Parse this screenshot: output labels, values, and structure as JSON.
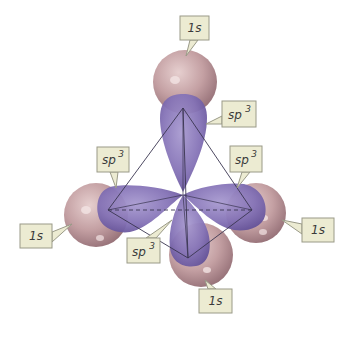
{
  "diagram": {
    "colors": {
      "background": "#ffffff",
      "s_orbital": "#c9a6a6",
      "s_orbital_dark": "#9c7a7e",
      "sp3_lobe": "#8a78b8",
      "sp3_lobe_dark": "#5e4d93",
      "label_fill": "#ecebd2",
      "label_border": "#9a9a88",
      "edge_line": "#3a3550"
    },
    "labels": [
      {
        "id": "top-1s",
        "text": "1s",
        "superscript": ""
      },
      {
        "id": "top-sp3",
        "text": "sp",
        "superscript": "3"
      },
      {
        "id": "left-sp3",
        "text": "sp",
        "superscript": "3"
      },
      {
        "id": "right-sp3",
        "text": "sp",
        "superscript": "3"
      },
      {
        "id": "left-1s",
        "text": "1s",
        "superscript": ""
      },
      {
        "id": "right-1s",
        "text": "1s",
        "superscript": ""
      },
      {
        "id": "bottom-sp3",
        "text": "sp",
        "superscript": "3"
      },
      {
        "id": "bottom-1s",
        "text": "1s",
        "superscript": ""
      }
    ]
  }
}
